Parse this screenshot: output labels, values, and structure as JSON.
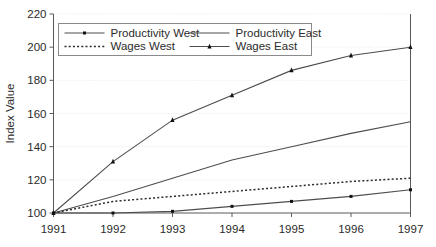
{
  "chart_data": {
    "type": "line",
    "title": "",
    "xlabel": "",
    "ylabel": "Index Value",
    "x": [
      1991,
      1992,
      1993,
      1994,
      1995,
      1996,
      1997
    ],
    "xtick_labels": [
      "1991",
      "1992",
      "1993",
      "1994",
      "1995",
      "1996",
      "1997"
    ],
    "ytick_labels": [
      "100",
      "120",
      "140",
      "160",
      "180",
      "200",
      "220"
    ],
    "yticks": [
      100,
      120,
      140,
      160,
      180,
      200,
      220
    ],
    "ylim": [
      100,
      220
    ],
    "xlim": [
      1991,
      1997
    ],
    "grid": true,
    "legend_position": "top-center",
    "series": [
      {
        "name": "Productivity West",
        "values": [
          100,
          100,
          101,
          104,
          107,
          110,
          114
        ],
        "marker": "square",
        "linestyle": "solid",
        "color": "#4d4d4d"
      },
      {
        "name": "Productivity East",
        "values": [
          100,
          110,
          121,
          132,
          140,
          148,
          155
        ],
        "marker": "none",
        "linestyle": "solid",
        "color": "#4d4d4d"
      },
      {
        "name": "Wages West",
        "values": [
          100,
          107,
          110,
          113,
          116,
          119,
          121
        ],
        "marker": "none",
        "linestyle": "dotted",
        "color": "#2b2b2b"
      },
      {
        "name": "Wages East",
        "values": [
          100,
          131,
          156,
          171,
          186,
          195,
          200
        ],
        "marker": "triangle",
        "linestyle": "solid",
        "color": "#4d4d4d"
      }
    ]
  },
  "legend": {
    "entries": [
      {
        "label": "Productivity West"
      },
      {
        "label": "Productivity East"
      },
      {
        "label": "Wages West"
      },
      {
        "label": "Wages East"
      }
    ]
  },
  "colors": {
    "axis": "#5a5a5a",
    "grid": "#e2e2e2",
    "line": "#4d4d4d",
    "marker": "#111111",
    "text": "#2b2b2b",
    "background": "#ffffff"
  }
}
